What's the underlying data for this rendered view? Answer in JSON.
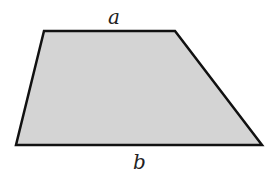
{
  "figure": {
    "shape": "trapezoid",
    "fill_color": "#d4d4d4",
    "stroke_color": "#111111",
    "vertices": {
      "top_left": [
        44,
        31
      ],
      "top_right": [
        175,
        31
      ],
      "bottom_right": [
        262,
        145
      ],
      "bottom_left": [
        16,
        145
      ]
    },
    "labels": {
      "top": "a",
      "bottom": "b"
    }
  }
}
